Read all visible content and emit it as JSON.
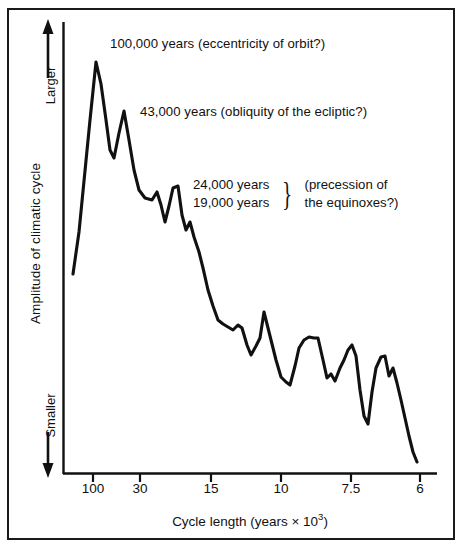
{
  "figure": {
    "background_color": "#ffffff",
    "line_color": "#111111",
    "frame_color": "#1a1a1a"
  },
  "chart_data": {
    "type": "line",
    "title": "",
    "subtitle": "",
    "xlabel": "Cycle length (years × 10³)",
    "xlabel_text": "Cycle length (years × 10",
    "xlabel_exponent": "3",
    "xlabel_tail": ")",
    "ylabel": "Amplitude of climatic cycle",
    "y_direction_top": "Larger",
    "y_direction_bottom": "Smaller",
    "grid": false,
    "legend": "none",
    "x_tick_labels": [
      "100",
      "30",
      "15",
      "10",
      "7.5",
      "6"
    ],
    "x_tick_values": [
      100,
      30,
      15,
      10,
      7.5,
      6
    ],
    "x_tick_pixels": [
      93,
      140,
      211,
      281,
      351,
      420
    ],
    "x_axis_scale": "inverse-period (frequency-like)",
    "y_axis_ticks": [],
    "ylim_note": "unlabeled relative amplitude axis",
    "annotations": [
      {
        "id": "eccentricity",
        "period_label": "100,000 years",
        "cause_label": "(eccentricity of orbit?)",
        "full_text": "100,000 years (eccentricity of orbit?)"
      },
      {
        "id": "obliquity",
        "period_label": "43,000 years",
        "cause_label": "(obliquity of the ecliptic?)",
        "full_text": "43,000 years (obliquity of the ecliptic?)"
      },
      {
        "id": "precession",
        "period_label_1": "24,000 years",
        "period_label_2": "19,000 years",
        "cause_label_1": "(precession of",
        "cause_label_2": "the equinoxes?)",
        "brace": "}"
      }
    ],
    "series": [
      {
        "name": "Amplitude of climatic cycle",
        "points": [
          [
            73,
            274
          ],
          [
            79,
            232
          ],
          [
            84,
            181
          ],
          [
            90,
            120
          ],
          [
            96,
            62
          ],
          [
            101,
            84
          ],
          [
            106,
            120
          ],
          [
            110,
            150
          ],
          [
            114,
            158
          ],
          [
            119,
            133
          ],
          [
            124,
            111
          ],
          [
            129,
            140
          ],
          [
            134,
            170
          ],
          [
            139,
            190
          ],
          [
            145,
            198
          ],
          [
            152,
            200
          ],
          [
            157,
            192
          ],
          [
            161,
            205
          ],
          [
            165,
            222
          ],
          [
            169,
            206
          ],
          [
            173,
            188
          ],
          [
            178,
            186
          ],
          [
            182,
            215
          ],
          [
            186,
            230
          ],
          [
            190,
            222
          ],
          [
            194,
            237
          ],
          [
            199,
            252
          ],
          [
            203,
            268
          ],
          [
            208,
            290
          ],
          [
            213,
            306
          ],
          [
            218,
            320
          ],
          [
            223,
            324
          ],
          [
            228,
            327
          ],
          [
            233,
            330
          ],
          [
            238,
            325
          ],
          [
            242,
            328
          ],
          [
            247,
            345
          ],
          [
            251,
            355
          ],
          [
            256,
            346
          ],
          [
            260,
            338
          ],
          [
            264,
            312
          ],
          [
            268,
            328
          ],
          [
            272,
            344
          ],
          [
            276,
            360
          ],
          [
            281,
            377
          ],
          [
            286,
            382
          ],
          [
            290,
            385
          ],
          [
            295,
            366
          ],
          [
            299,
            348
          ],
          [
            304,
            340
          ],
          [
            309,
            337
          ],
          [
            314,
            338
          ],
          [
            318,
            338
          ],
          [
            323,
            360
          ],
          [
            327,
            378
          ],
          [
            331,
            374
          ],
          [
            335,
            381
          ],
          [
            340,
            368
          ],
          [
            344,
            360
          ],
          [
            348,
            350
          ],
          [
            352,
            345
          ],
          [
            356,
            356
          ],
          [
            360,
            390
          ],
          [
            364,
            416
          ],
          [
            368,
            424
          ],
          [
            372,
            392
          ],
          [
            376,
            368
          ],
          [
            381,
            357
          ],
          [
            385,
            356
          ],
          [
            389,
            376
          ],
          [
            393,
            368
          ],
          [
            397,
            383
          ],
          [
            401,
            400
          ],
          [
            405,
            418
          ],
          [
            409,
            436
          ],
          [
            413,
            452
          ],
          [
            417,
            462
          ]
        ],
        "description": "Spectral amplitude declining from the 100,000-year peak toward shorter cycle lengths, with secondary peaks near 43,000, 24,000 and 19,000 years."
      }
    ]
  },
  "axis_geometry": {
    "plot_left": 63,
    "plot_right": 437,
    "plot_top": 22,
    "plot_bottom": 474
  }
}
